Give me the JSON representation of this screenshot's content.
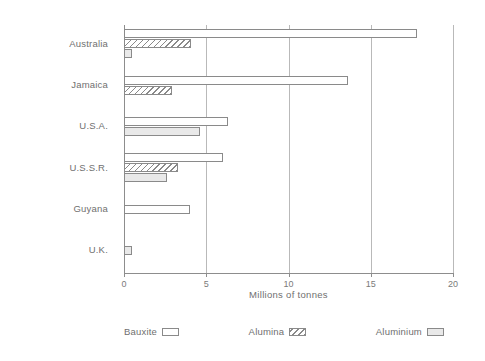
{
  "chart_data": {
    "type": "bar",
    "orientation": "horizontal",
    "title": "",
    "xlabel": "Millions of tonnes",
    "ylabel": "",
    "xlim": [
      0,
      20
    ],
    "xticks": [
      0,
      5,
      10,
      15,
      20
    ],
    "xtick_labels": [
      "0",
      "5",
      "10",
      "15",
      "20"
    ],
    "grid": true,
    "grid_axis": "x",
    "legend_position": "bottom",
    "categories": [
      "Australia",
      "Jamaica",
      "U.S.A.",
      "U.S.S.R.",
      "Guyana",
      "U.K."
    ],
    "series": [
      {
        "name": "Bauxite",
        "fill": "white",
        "values": [
          17.8,
          13.6,
          6.3,
          6.0,
          4.0,
          0.0
        ]
      },
      {
        "name": "Alumina",
        "fill": "hatch",
        "values": [
          4.1,
          2.9,
          0.0,
          3.3,
          0.0,
          0.0
        ]
      },
      {
        "name": "Aluminium",
        "fill": "gray",
        "values": [
          0.5,
          0.0,
          4.6,
          2.6,
          0.0,
          0.5
        ]
      }
    ]
  },
  "axis": {
    "x_title": "Millions of tonnes",
    "ticks": [
      {
        "value": 0,
        "label": "0"
      },
      {
        "value": 5,
        "label": "5"
      },
      {
        "value": 10,
        "label": "10"
      },
      {
        "value": 15,
        "label": "15"
      },
      {
        "value": 20,
        "label": "20"
      }
    ]
  },
  "categories": [
    {
      "label": "Australia"
    },
    {
      "label": "Jamaica"
    },
    {
      "label": "U.S.A."
    },
    {
      "label": "U.S.S.R."
    },
    {
      "label": "Guyana"
    },
    {
      "label": "U.K."
    }
  ],
  "legend": {
    "items": [
      {
        "label": "Bauxite",
        "swatch": "white-swatch"
      },
      {
        "label": "Alumina",
        "swatch": "hatched-swatch"
      },
      {
        "label": "Aluminium",
        "swatch": "gray-swatch"
      }
    ]
  },
  "colors": {
    "background": "#ffffff",
    "axis": "#8d8d8d",
    "grid": "#b9b9b9",
    "bar_outline": "#8a8a8a",
    "bauxite_fill": "#ffffff",
    "alumina_fill": "#ffffff",
    "aluminium_fill": "#e9e9e9",
    "text": "#6f6f6f"
  }
}
